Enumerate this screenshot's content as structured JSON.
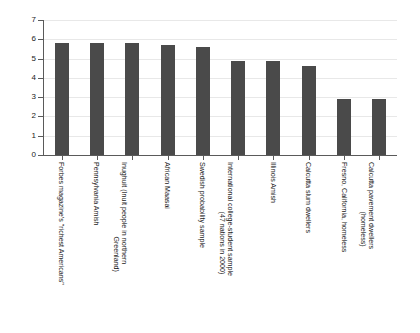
{
  "chart_data": {
    "type": "bar",
    "title": "",
    "subtitle": "",
    "xlabel": "",
    "ylabel": "",
    "ylim": [
      0,
      7
    ],
    "yticks": [
      0,
      1,
      2,
      3,
      4,
      5,
      6,
      7
    ],
    "ytick_labels": [
      "0",
      "1",
      "2",
      "3",
      "4",
      "5",
      "6",
      "7"
    ],
    "grid": true,
    "grid_axis": "y",
    "legend": false,
    "bar_color": "#4a4a4a",
    "categories": [
      "Forbes magazine's \"richest Americans\"",
      "Pennsylvania Amish",
      "Inughuit (Inuit people in northern Greenland)",
      "African Maasai",
      "Swedish probability sample",
      "International college-student sample (47 nations in 2000)",
      "Illinois Amish",
      "Calcutta slum dwellers",
      "Fresno, California, homeless",
      "Calcutta pavement dwellers (homeless)"
    ],
    "category_lines": [
      [
        "Forbes magazine's \"richest Americans\"",
        ""
      ],
      [
        "Pennsylvania Amish",
        ""
      ],
      [
        "Inughuit (Inuit people in northern",
        "Greenland)"
      ],
      [
        "African Maasai",
        ""
      ],
      [
        "Swedish probability sample",
        ""
      ],
      [
        "International college-student sample",
        "(47 nations in 2000)"
      ],
      [
        "Illinois Amish",
        ""
      ],
      [
        "Calcutta slum dwellers",
        ""
      ],
      [
        "Fresno, California, homeless",
        ""
      ],
      [
        "Calcutta pavement dwellers",
        "(homeless)"
      ]
    ],
    "values": [
      5.8,
      5.8,
      5.8,
      5.7,
      5.6,
      4.9,
      4.9,
      4.6,
      2.9,
      2.9
    ]
  }
}
